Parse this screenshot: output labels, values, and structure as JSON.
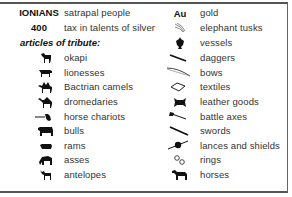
{
  "legend": {
    "people": {
      "key": "IONIANS",
      "label": "satrapal people"
    },
    "tax": {
      "key": "400",
      "label": "tax in talents of silver"
    },
    "tribute_header": "articles of tribute:",
    "left_items": [
      {
        "icon": "okapi-icon",
        "label": "okapi"
      },
      {
        "icon": "lioness-icon",
        "label": "lionesses"
      },
      {
        "icon": "bactrian-camel-icon",
        "label": "Bactrian camels"
      },
      {
        "icon": "dromedary-icon",
        "label": "dromedaries"
      },
      {
        "icon": "horse-chariot-icon",
        "label": "horse chariots"
      },
      {
        "icon": "bull-icon",
        "label": "bulls"
      },
      {
        "icon": "ram-icon",
        "label": "rams"
      },
      {
        "icon": "ass-icon",
        "label": "asses"
      },
      {
        "icon": "antelope-icon",
        "label": "antelopes"
      }
    ],
    "right_items": [
      {
        "icon": "gold-icon",
        "symbol": "Au",
        "label": "gold"
      },
      {
        "icon": "elephant-tusk-icon",
        "label": "elephant tusks"
      },
      {
        "icon": "vessel-icon",
        "label": "vessels"
      },
      {
        "icon": "dagger-icon",
        "label": "daggers"
      },
      {
        "icon": "bow-icon",
        "label": "bows"
      },
      {
        "icon": "textile-icon",
        "label": "textiles"
      },
      {
        "icon": "leather-goods-icon",
        "label": "leather goods"
      },
      {
        "icon": "battle-axe-icon",
        "label": "battle axes"
      },
      {
        "icon": "sword-icon",
        "label": "swords"
      },
      {
        "icon": "lance-shield-icon",
        "label": "lances and shields"
      },
      {
        "icon": "ring-icon",
        "label": "rings"
      },
      {
        "icon": "horse-icon",
        "label": "horses"
      }
    ]
  }
}
